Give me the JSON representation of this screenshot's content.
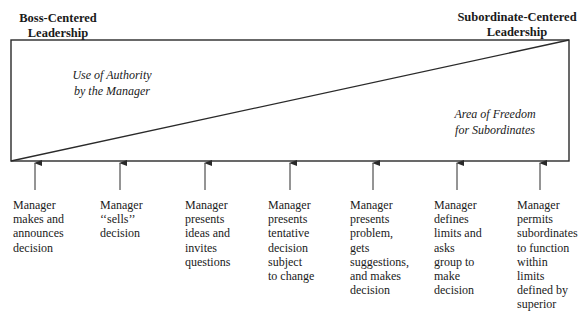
{
  "headings": {
    "left": [
      "Boss-Centered",
      "Leadership"
    ],
    "right": [
      "Subordinate-Centered",
      "Leadership"
    ]
  },
  "regions": {
    "upper_left": [
      "Use of Authority",
      "by the Manager"
    ],
    "lower_right": [
      "Area of Freedom",
      "for Subordinates"
    ]
  },
  "colors": {
    "line": "#2a2a2a",
    "text": "#1a1a1a",
    "background": "#ffffff"
  },
  "behaviors": [
    {
      "lines": [
        "Manager",
        "makes and",
        "announces",
        "decision"
      ]
    },
    {
      "lines": [
        "Manager",
        "‘‘sells’’",
        "decision"
      ]
    },
    {
      "lines": [
        "Manager",
        "presents",
        "ideas and",
        "invites",
        "questions"
      ]
    },
    {
      "lines": [
        "Manager",
        "presents",
        "tentative",
        "decision",
        "subject",
        "to change"
      ]
    },
    {
      "lines": [
        "Manager",
        "presents",
        "problem,",
        "gets",
        "suggestions,",
        "and makes",
        "decision"
      ]
    },
    {
      "lines": [
        "Manager",
        "defines",
        "limits and",
        "asks",
        "group to",
        "make",
        "decision"
      ]
    },
    {
      "lines": [
        "Manager",
        "permits",
        "subordinates",
        "to function",
        "within",
        "limits",
        "defined by",
        "superior"
      ]
    }
  ]
}
